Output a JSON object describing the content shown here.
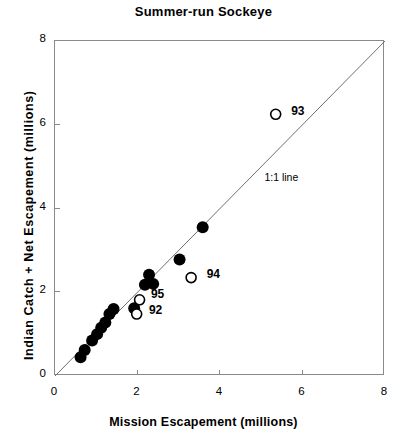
{
  "chart_data": {
    "type": "scatter",
    "title": "Summer-run Sockeye",
    "xlabel": "Mission Escapement (millions)",
    "ylabel": "Indian Catch + Net Escapement (millions)",
    "xlim": [
      0,
      8
    ],
    "ylim": [
      0,
      8
    ],
    "xticks": [
      0,
      2,
      4,
      6,
      8
    ],
    "yticks": [
      0,
      2,
      4,
      6,
      8
    ],
    "grid": false,
    "legend": "none",
    "reference_line": {
      "label": "1:1 line",
      "slope": 1,
      "intercept": 0,
      "label_x": 5.1,
      "label_y": 4.7
    },
    "series": [
      {
        "name": "filled",
        "marker": "filled-circle",
        "color": "#000000",
        "points": [
          {
            "x": 0.62,
            "y": 0.45
          },
          {
            "x": 0.72,
            "y": 0.62
          },
          {
            "x": 0.9,
            "y": 0.85
          },
          {
            "x": 1.02,
            "y": 1.0
          },
          {
            "x": 1.12,
            "y": 1.15
          },
          {
            "x": 1.22,
            "y": 1.28
          },
          {
            "x": 1.32,
            "y": 1.48
          },
          {
            "x": 1.42,
            "y": 1.6
          },
          {
            "x": 1.92,
            "y": 1.62
          },
          {
            "x": 2.18,
            "y": 2.18
          },
          {
            "x": 2.28,
            "y": 2.42
          },
          {
            "x": 2.38,
            "y": 2.2
          },
          {
            "x": 3.02,
            "y": 2.78
          },
          {
            "x": 3.58,
            "y": 3.55
          }
        ]
      },
      {
        "name": "labelled-open",
        "marker": "open-circle",
        "color": "#000000",
        "points": [
          {
            "x": 5.35,
            "y": 6.25,
            "label": "93"
          },
          {
            "x": 3.3,
            "y": 2.35,
            "label": "94"
          },
          {
            "x": 2.05,
            "y": 1.82,
            "label": "95"
          },
          {
            "x": 1.98,
            "y": 1.48,
            "label": "92"
          }
        ]
      }
    ],
    "point_labels": [
      {
        "text": "93",
        "x": 5.75,
        "y": 6.28
      },
      {
        "text": "94",
        "x": 3.7,
        "y": 2.38
      },
      {
        "text": "95",
        "x": 2.35,
        "y": 1.92
      },
      {
        "text": "92",
        "x": 2.3,
        "y": 1.52
      }
    ]
  }
}
